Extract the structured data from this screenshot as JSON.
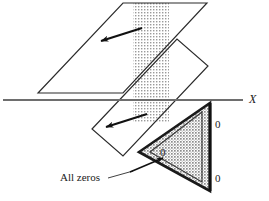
{
  "figure": {
    "title": "",
    "axis_label": "X",
    "annotations": {
      "all_zeros": "All zeros",
      "zero_top": "0",
      "zero_bottom": "0",
      "zero_inner": "0"
    },
    "colors": {
      "line": "#2b2b2b",
      "axis": "#6e6e6e",
      "stipple": "#b9b9b9",
      "triangle_fill": "#c9c9c9",
      "triangle_stroke": "#1a1a1a",
      "arrow": "#111111",
      "background": "#ffffff"
    }
  },
  "geometry": {
    "axis": {
      "x1": 3,
      "y1": 100,
      "x2": 243,
      "y2": 100
    },
    "band": {
      "x": 133,
      "y": 3,
      "width": 36,
      "height": 119
    },
    "parallelogram_upper": "38,93 123,3 207,3 123,93",
    "parallelogram_lower": "92,129 177,39 208,66 123,156",
    "triangle_outer": "210,103 210,191 139,152",
    "triangle_inner": "202,112 202,182 150,152",
    "arrow_upper": {
      "x1": 142,
      "y1": 28,
      "x2": 101,
      "y2": 41
    },
    "arrow_lower": {
      "x1": 147,
      "y1": 114,
      "x2": 106,
      "y2": 127
    },
    "arrow_callout": {
      "x1": 130,
      "y1": 172,
      "x2": 163,
      "y2": 158
    },
    "leader_line": {
      "x1": 108,
      "y1": 178,
      "x2": 133,
      "y2": 171
    }
  },
  "labels": {
    "x_axis": {
      "text": "X",
      "x": 249,
      "y": 93
    },
    "zero_top": {
      "text": "0",
      "x": 215,
      "y": 119
    },
    "zero_bottom": {
      "text": "0",
      "x": 215,
      "y": 173
    },
    "zero_inner": {
      "text": "0",
      "x": 160,
      "y": 147
    },
    "all_zeros": {
      "text": "All zeros",
      "x": 60,
      "y": 172
    }
  }
}
